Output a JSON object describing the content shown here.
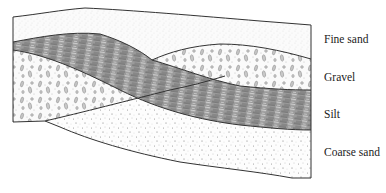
{
  "diagram": {
    "type": "geological cross-section",
    "layers": [
      {
        "name": "Fine sand",
        "pattern": "fine stipple"
      },
      {
        "name": "Gravel",
        "pattern": "ovals and dots"
      },
      {
        "name": "Silt",
        "pattern": "dark streaks"
      },
      {
        "name": "Coarse sand",
        "pattern": "coarse stipple"
      }
    ],
    "labels": {
      "fine_sand": "Fine sand",
      "gravel": "Gravel",
      "silt": "Silt",
      "coarse_sand": "Coarse sand"
    },
    "colors": {
      "outline": "#333333",
      "silt_fill": "#8c8c8c",
      "gravel_pebble": "#9a9a9a",
      "background": "#ffffff"
    }
  }
}
